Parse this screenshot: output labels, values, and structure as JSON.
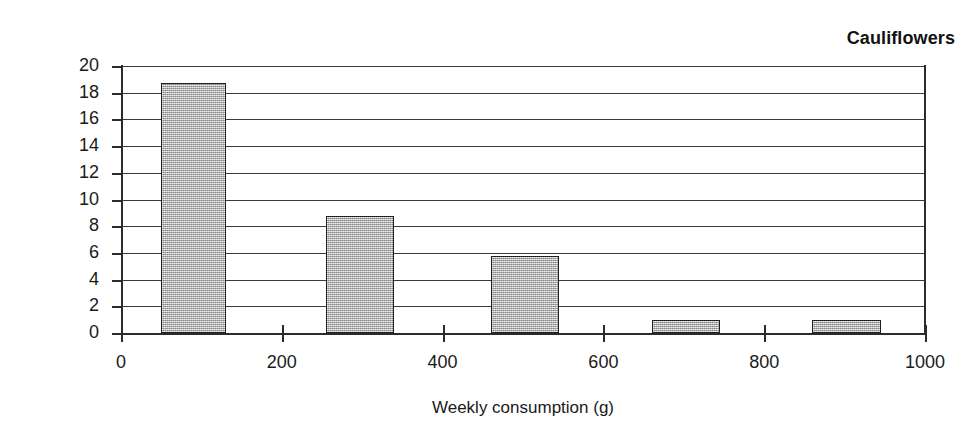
{
  "chart_data": {
    "type": "bar",
    "title": "Cauliflowers",
    "xlabel": "Weekly consumption (g)",
    "ylabel": "Number of people",
    "grid": true,
    "legend": null,
    "xlim": [
      0,
      1000
    ],
    "ylim": [
      0,
      20
    ],
    "xticks": [
      0,
      200,
      400,
      600,
      800,
      1000
    ],
    "xtick_labels": [
      "0",
      "200",
      "400",
      "600",
      "800",
      "1000"
    ],
    "yticks": [
      0,
      2,
      4,
      6,
      8,
      10,
      12,
      14,
      16,
      18,
      20
    ],
    "ytick_labels": [
      "0",
      "2",
      "4",
      "6",
      "8",
      "10",
      "12",
      "14",
      "16",
      "18",
      "20"
    ],
    "bar_color": "#b0b0b0",
    "bar_edge_color": "#1f1f1f",
    "bins": [
      {
        "label": "50-130",
        "x_start": 50,
        "x_end": 130,
        "value": 18.7
      },
      {
        "label": "255-340",
        "x_start": 255,
        "x_end": 340,
        "value": 8.75
      },
      {
        "label": "460-545",
        "x_start": 460,
        "x_end": 545,
        "value": 5.8
      },
      {
        "label": "660-745",
        "x_start": 660,
        "x_end": 745,
        "value": 1.0
      },
      {
        "label": "860-945",
        "x_start": 860,
        "x_end": 945,
        "value": 1.0
      }
    ],
    "values": [
      18.7,
      8.75,
      5.8,
      1.0,
      1.0
    ],
    "categories": [
      "50-130",
      "255-340",
      "460-545",
      "660-745",
      "860-945"
    ]
  }
}
